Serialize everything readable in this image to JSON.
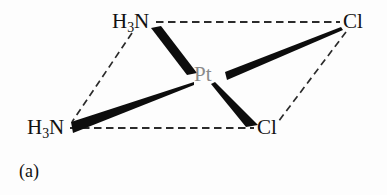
{
  "figure": {
    "caption": "(a)",
    "compound": "cisplatin",
    "colors": {
      "bond_solid": "#0d0d0d",
      "bond_dashed": "#2b2b2b",
      "label_text": "#111111",
      "metal_text": "#8a8a8a",
      "background": "#fdfdfd"
    }
  },
  "atoms": {
    "nitrogen_top": {
      "formula_main_1": "H",
      "formula_sub": "3",
      "formula_main_2": "N",
      "full": "H3N",
      "position": {
        "x": 112,
        "y": 11
      }
    },
    "nitrogen_bottom": {
      "formula_main_1": "H",
      "formula_sub": "3",
      "formula_main_2": "N",
      "full": "H3N",
      "position": {
        "x": 27,
        "y": 117
      }
    },
    "chlorine_top": {
      "symbol": "Cl",
      "position": {
        "x": 343,
        "y": 11
      }
    },
    "chlorine_bottom": {
      "symbol": "Cl",
      "position": {
        "x": 257,
        "y": 117
      }
    },
    "platinum_center": {
      "symbol": "Pt",
      "position": {
        "x": 194,
        "y": 64
      }
    }
  },
  "bonds": {
    "dashed": [
      {
        "name": "n-top-to-cl-top",
        "from": "nitrogen_top",
        "to": "chlorine_top"
      },
      {
        "name": "n-bottom-to-cl-bottom",
        "from": "nitrogen_bottom",
        "to": "chlorine_bottom"
      },
      {
        "name": "n-top-to-n-bottom",
        "from": "nitrogen_top",
        "to": "nitrogen_bottom"
      },
      {
        "name": "cl-top-to-cl-bottom",
        "from": "chlorine_top",
        "to": "chlorine_bottom"
      }
    ],
    "wedges": [
      {
        "name": "n-top-to-pt",
        "from": "nitrogen_top",
        "to": "platinum_center",
        "wide_at": "platinum_center"
      },
      {
        "name": "cl-top-to-pt",
        "from": "chlorine_top",
        "to": "platinum_center",
        "wide_at": "platinum_center"
      },
      {
        "name": "n-bottom-to-pt",
        "from": "nitrogen_bottom",
        "to": "platinum_center",
        "wide_at": "nitrogen_bottom"
      },
      {
        "name": "pt-to-cl-bottom",
        "from": "platinum_center",
        "to": "chlorine_bottom",
        "wide_at": "chlorine_bottom"
      }
    ]
  }
}
